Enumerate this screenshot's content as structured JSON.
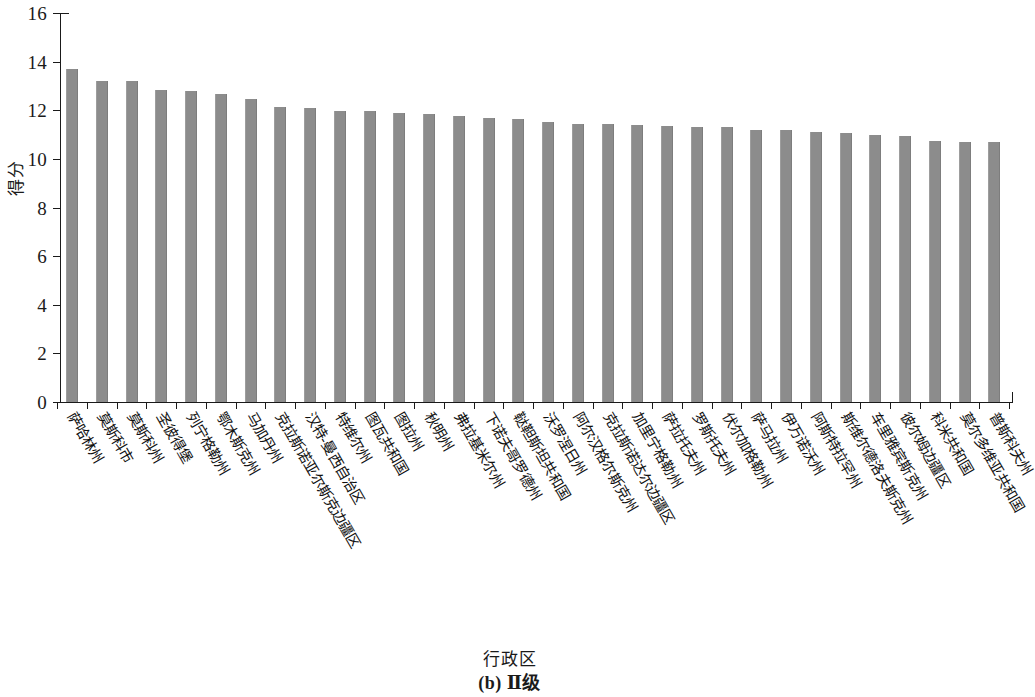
{
  "chart_data": {
    "type": "bar",
    "title": "",
    "caption": "(b) Ⅱ级",
    "xlabel": "行政区",
    "ylabel": "得分",
    "ylim": [
      0,
      16
    ],
    "ytick_values": [
      0,
      2,
      4,
      6,
      8,
      10,
      12,
      14,
      16
    ],
    "ytick_labels": [
      "0",
      "2",
      "4",
      "6",
      "8",
      "10",
      "12",
      "14",
      "16"
    ],
    "grid": false,
    "legend": "none",
    "bar_color": "#8c8c8c",
    "axis_color": "#1a1a1a",
    "categories": [
      "萨哈林州",
      "莫斯科市",
      "莫斯科州",
      "圣彼得堡",
      "列宁格勒州",
      "鄂木斯克州",
      "马加丹州",
      "克拉斯诺亚尔斯克边疆区",
      "汉特-曼西自治区",
      "特维尔州",
      "图瓦共和国",
      "图拉州",
      "秋明州",
      "弗拉基米尔州",
      "下诺夫哥罗德州",
      "鞑靼斯坦共和国",
      "沃罗涅日州",
      "阿尔汉格尔斯克州",
      "克拉斯诺达尔边疆区",
      "加里宁格勒州",
      "萨拉托夫州",
      "罗斯托夫州",
      "伏尔加格勒州",
      "萨马拉州",
      "伊万诺沃州",
      "阿斯特拉罕州",
      "斯维尔德洛夫斯克州",
      "车里雅宾斯克州",
      "彼尔姆边疆区",
      "科米共和国",
      "莫尔多维亚共和国",
      "普斯科夫州"
    ],
    "values": [
      13.7,
      13.2,
      13.2,
      12.85,
      12.8,
      12.65,
      12.45,
      12.15,
      12.1,
      11.95,
      11.95,
      11.9,
      11.85,
      11.75,
      11.7,
      11.65,
      11.5,
      11.45,
      11.45,
      11.4,
      11.35,
      11.3,
      11.3,
      11.2,
      11.2,
      11.1,
      11.05,
      11.0,
      10.95,
      10.75,
      10.7,
      10.7
    ]
  }
}
